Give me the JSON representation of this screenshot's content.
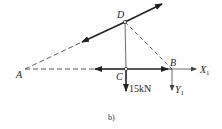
{
  "figure": {
    "caption": "b)",
    "points": {
      "A": {
        "label": "A",
        "x": 25,
        "y": 69
      },
      "B": {
        "label": "B",
        "x": 172,
        "y": 69
      },
      "C": {
        "label": "C",
        "x": 126,
        "y": 69
      },
      "D": {
        "label": "D",
        "x": 125,
        "y": 22
      }
    },
    "loads": {
      "C_load": {
        "label": "15kN",
        "direction": "down"
      }
    },
    "reactions": {
      "X1": {
        "label": "X",
        "subscript": "1",
        "direction": "right"
      },
      "Y1": {
        "label": "Y",
        "subscript": "1",
        "direction": "down"
      }
    },
    "colors": {
      "line": "#222222",
      "dashed": "#333333",
      "background": "#ffffff"
    }
  }
}
